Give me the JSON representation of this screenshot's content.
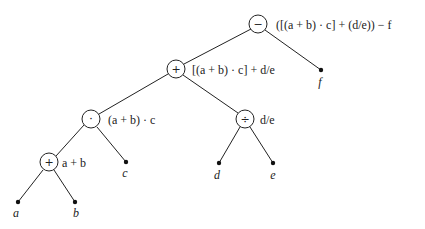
{
  "diagram": {
    "type": "expression-tree",
    "expression": "([(a + b) · c] + (d/e)) − f",
    "operator_nodes": [
      {
        "id": "root",
        "symbol": "−",
        "label": "([(a + b) · c] + (d/e)) − f",
        "x": 258,
        "y": 24
      },
      {
        "id": "plus1",
        "symbol": "+",
        "label": "[(a + b) · c] + d/e",
        "x": 176,
        "y": 69
      },
      {
        "id": "times",
        "symbol": "·",
        "label": "(a + b) · c",
        "x": 91,
        "y": 119
      },
      {
        "id": "div",
        "symbol": "÷",
        "label": "d/e",
        "x": 245,
        "y": 119
      },
      {
        "id": "plus2",
        "symbol": "+",
        "label": "a + b",
        "x": 49,
        "y": 162
      }
    ],
    "leaf_nodes": [
      {
        "id": "f",
        "label": "f",
        "x": 321,
        "y": 70
      },
      {
        "id": "c",
        "label": "c",
        "x": 126,
        "y": 162
      },
      {
        "id": "d",
        "label": "d",
        "x": 219,
        "y": 163
      },
      {
        "id": "e",
        "label": "e",
        "x": 273,
        "y": 163
      },
      {
        "id": "a",
        "label": "a",
        "x": 18,
        "y": 202
      },
      {
        "id": "b",
        "label": "b",
        "x": 75,
        "y": 202
      }
    ],
    "edges": [
      [
        "root",
        "plus1"
      ],
      [
        "root",
        "f"
      ],
      [
        "plus1",
        "times"
      ],
      [
        "plus1",
        "div"
      ],
      [
        "times",
        "plus2"
      ],
      [
        "times",
        "c"
      ],
      [
        "div",
        "d"
      ],
      [
        "div",
        "e"
      ],
      [
        "plus2",
        "a"
      ],
      [
        "plus2",
        "b"
      ]
    ]
  }
}
